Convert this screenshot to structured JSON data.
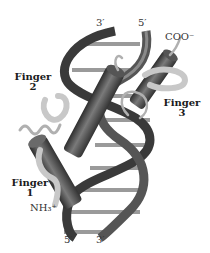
{
  "figure": {
    "labels": {
      "top_strand_3": "3′",
      "top_strand_5": "5′",
      "bottom_strand_5": "5′",
      "bottom_strand_3": "3′",
      "c_terminus": "COO⁻",
      "n_terminus": "NH₃⁺",
      "finger1": "Finger",
      "finger1_num": "1",
      "finger2": "Finger",
      "finger2_num": "2",
      "finger3": "Finger",
      "finger3_num": "3"
    },
    "colors": {
      "dna_backbone": "#3a3a3a",
      "dna_backbone_light": "#8a8a8a",
      "base_pairs": "#9a9a9a",
      "helix_cylinder": "#4a4a4a",
      "beta_ribbon": "#c8c8c8",
      "loop": "#b0b0b0",
      "background": "#ffffff"
    }
  }
}
